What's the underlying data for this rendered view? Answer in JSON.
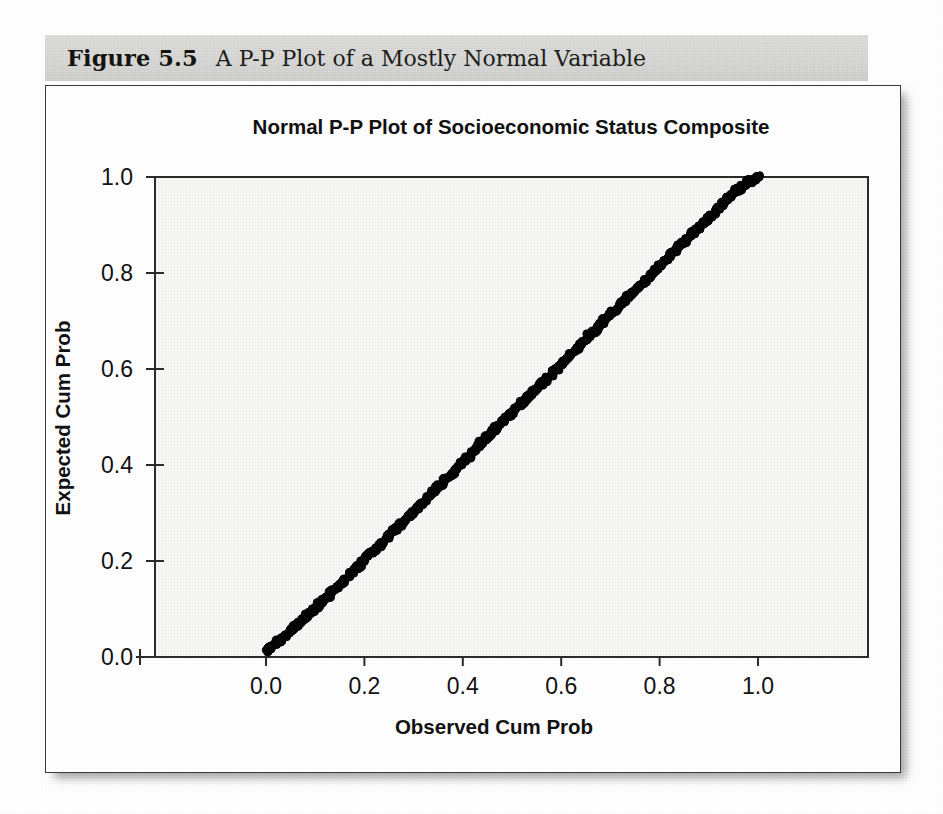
{
  "figure": {
    "number_label": "Figure 5.5",
    "caption": "A P-P Plot of a Mostly Normal Variable"
  },
  "chart_data": {
    "type": "scatter",
    "title": "Normal P-P Plot of Socioeconomic Status Composite",
    "xlabel": "Observed Cum Prob",
    "ylabel": "Expected Cum Prob",
    "xlim": [
      -0.05,
      1.12
    ],
    "ylim": [
      -0.03,
      1.02
    ],
    "xticks": [
      0.0,
      0.2,
      0.4,
      0.6,
      0.8,
      1.0
    ],
    "yticks": [
      0.0,
      0.2,
      0.4,
      0.6,
      0.8,
      1.0
    ],
    "xtick_labels": [
      "0.0",
      "0.2",
      "0.4",
      "0.6",
      "0.8",
      "1.0"
    ],
    "ytick_labels": [
      "0.0",
      "0.2",
      "0.4",
      "0.6",
      "0.8",
      "1.0"
    ],
    "grid": false,
    "legend": false,
    "marker": "open-circle",
    "marker_color": "#090909",
    "plot_background": "#f6f6f4",
    "series": [
      {
        "name": "Socioeconomic Status Composite",
        "description": "Dense overlapping open-circle markers tracking the 45-degree reference diagonal from (0.0,0.0) to (1.0,1.0), with slight wobble above and below the line and a small thinning near observed 0.37",
        "x": [
          0.0,
          0.004,
          0.008,
          0.012,
          0.016,
          0.02,
          0.024,
          0.028,
          0.032,
          0.036,
          0.04,
          0.044,
          0.048,
          0.052,
          0.056,
          0.06,
          0.064,
          0.068,
          0.072,
          0.076,
          0.08,
          0.084,
          0.088,
          0.092,
          0.096,
          0.1,
          0.104,
          0.108,
          0.112,
          0.116,
          0.12,
          0.124,
          0.128,
          0.132,
          0.136,
          0.14,
          0.144,
          0.148,
          0.152,
          0.156,
          0.16,
          0.164,
          0.168,
          0.172,
          0.176,
          0.18,
          0.184,
          0.188,
          0.192,
          0.196,
          0.2,
          0.204,
          0.208,
          0.212,
          0.216,
          0.22,
          0.224,
          0.228,
          0.232,
          0.236,
          0.24,
          0.244,
          0.248,
          0.252,
          0.256,
          0.26,
          0.264,
          0.268,
          0.272,
          0.276,
          0.28,
          0.284,
          0.288,
          0.292,
          0.296,
          0.3,
          0.304,
          0.308,
          0.312,
          0.316,
          0.32,
          0.324,
          0.328,
          0.332,
          0.336,
          0.34,
          0.344,
          0.348,
          0.352,
          0.356,
          0.36,
          0.364,
          0.368,
          0.372,
          0.376,
          0.38,
          0.384,
          0.388,
          0.392,
          0.396,
          0.4,
          0.404,
          0.408,
          0.412,
          0.416,
          0.42,
          0.424,
          0.428,
          0.432,
          0.436,
          0.44,
          0.444,
          0.448,
          0.452,
          0.456,
          0.46,
          0.464,
          0.468,
          0.472,
          0.476,
          0.48,
          0.484,
          0.488,
          0.492,
          0.496,
          0.5,
          0.504,
          0.508,
          0.512,
          0.516,
          0.52,
          0.524,
          0.528,
          0.532,
          0.536,
          0.54,
          0.544,
          0.548,
          0.552,
          0.556,
          0.56,
          0.564,
          0.568,
          0.572,
          0.576,
          0.58,
          0.584,
          0.588,
          0.592,
          0.596,
          0.6,
          0.604,
          0.608,
          0.612,
          0.616,
          0.62,
          0.624,
          0.628,
          0.632,
          0.636,
          0.64,
          0.644,
          0.648,
          0.652,
          0.656,
          0.66,
          0.664,
          0.668,
          0.672,
          0.676,
          0.68,
          0.684,
          0.688,
          0.692,
          0.696,
          0.7,
          0.704,
          0.708,
          0.712,
          0.716,
          0.72,
          0.724,
          0.728,
          0.732,
          0.736,
          0.74,
          0.744,
          0.748,
          0.752,
          0.756,
          0.76,
          0.764,
          0.768,
          0.772,
          0.776,
          0.78,
          0.784,
          0.788,
          0.792,
          0.796,
          0.8,
          0.804,
          0.808,
          0.812,
          0.816,
          0.82,
          0.824,
          0.828,
          0.832,
          0.836,
          0.84,
          0.844,
          0.848,
          0.852,
          0.856,
          0.86,
          0.864,
          0.868,
          0.872,
          0.876,
          0.88,
          0.884,
          0.888,
          0.892,
          0.896,
          0.9,
          0.904,
          0.908,
          0.912,
          0.916,
          0.92,
          0.924,
          0.928,
          0.932,
          0.936,
          0.94,
          0.944,
          0.948,
          0.952,
          0.956,
          0.96,
          0.964,
          0.968,
          0.972,
          0.976,
          0.98,
          0.984,
          0.988,
          0.992,
          0.996,
          1.0
        ],
        "y": [
          0.013,
          0.016,
          0.019,
          0.022,
          0.025,
          0.028,
          0.031,
          0.034,
          0.038,
          0.042,
          0.046,
          0.05,
          0.054,
          0.058,
          0.061,
          0.064,
          0.067,
          0.071,
          0.075,
          0.079,
          0.083,
          0.087,
          0.091,
          0.094,
          0.097,
          0.101,
          0.105,
          0.11,
          0.114,
          0.118,
          0.121,
          0.124,
          0.128,
          0.133,
          0.137,
          0.141,
          0.145,
          0.149,
          0.153,
          0.157,
          0.161,
          0.165,
          0.169,
          0.173,
          0.177,
          0.181,
          0.185,
          0.189,
          0.193,
          0.197,
          0.202,
          0.207,
          0.211,
          0.214,
          0.218,
          0.222,
          0.226,
          0.23,
          0.234,
          0.238,
          0.243,
          0.247,
          0.251,
          0.255,
          0.258,
          0.262,
          0.266,
          0.27,
          0.275,
          0.279,
          0.283,
          0.287,
          0.291,
          0.295,
          0.299,
          0.303,
          0.307,
          0.311,
          0.315,
          0.319,
          0.323,
          0.327,
          0.331,
          0.335,
          0.339,
          0.343,
          0.348,
          0.353,
          0.357,
          0.361,
          0.365,
          0.369,
          0.373,
          0.377,
          0.38,
          0.384,
          0.388,
          0.393,
          0.398,
          0.403,
          0.407,
          0.411,
          0.415,
          0.419,
          0.423,
          0.427,
          0.432,
          0.437,
          0.441,
          0.445,
          0.449,
          0.453,
          0.457,
          0.461,
          0.465,
          0.469,
          0.473,
          0.477,
          0.481,
          0.485,
          0.489,
          0.493,
          0.497,
          0.501,
          0.505,
          0.509,
          0.513,
          0.517,
          0.521,
          0.525,
          0.529,
          0.533,
          0.537,
          0.541,
          0.545,
          0.549,
          0.553,
          0.557,
          0.561,
          0.565,
          0.569,
          0.573,
          0.577,
          0.581,
          0.585,
          0.589,
          0.593,
          0.597,
          0.601,
          0.605,
          0.609,
          0.613,
          0.617,
          0.621,
          0.625,
          0.629,
          0.633,
          0.637,
          0.641,
          0.645,
          0.649,
          0.654,
          0.659,
          0.664,
          0.669,
          0.673,
          0.677,
          0.681,
          0.685,
          0.689,
          0.693,
          0.697,
          0.701,
          0.705,
          0.709,
          0.713,
          0.717,
          0.721,
          0.725,
          0.729,
          0.733,
          0.737,
          0.741,
          0.745,
          0.749,
          0.753,
          0.757,
          0.761,
          0.765,
          0.769,
          0.773,
          0.777,
          0.781,
          0.785,
          0.789,
          0.793,
          0.797,
          0.801,
          0.805,
          0.809,
          0.813,
          0.818,
          0.823,
          0.827,
          0.831,
          0.835,
          0.839,
          0.843,
          0.847,
          0.851,
          0.855,
          0.859,
          0.863,
          0.867,
          0.871,
          0.875,
          0.879,
          0.883,
          0.887,
          0.891,
          0.895,
          0.899,
          0.903,
          0.907,
          0.911,
          0.915,
          0.919,
          0.923,
          0.927,
          0.931,
          0.935,
          0.939,
          0.943,
          0.947,
          0.951,
          0.955,
          0.959,
          0.963,
          0.967,
          0.971,
          0.974,
          0.977,
          0.98,
          0.983,
          0.986,
          0.989,
          0.992,
          0.994,
          0.996,
          0.998,
          1.0
        ]
      }
    ]
  }
}
